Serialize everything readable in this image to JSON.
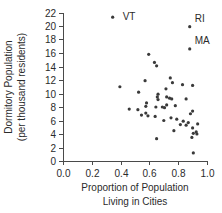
{
  "chart_data": {
    "type": "scatter",
    "title": "",
    "xlabel": "Proportion of Population Living in Cities",
    "xlabel_line1": "Proportion of Population",
    "xlabel_line2": "Living in Cities",
    "ylabel": "Dormitory Population (per thousand residents)",
    "ylabel_line1": "Dormitory Population",
    "ylabel_line2": "(per thousand residents)",
    "xlim": [
      0.0,
      1.0
    ],
    "ylim": [
      0,
      22
    ],
    "xticks": [
      "0.0",
      "0.2",
      "0.4",
      "0.6",
      "0.8",
      "1.0"
    ],
    "xtick_values": [
      0.0,
      0.2,
      0.4,
      0.6,
      0.8,
      1.0
    ],
    "yticks": [
      "0",
      "2",
      "4",
      "6",
      "8",
      "10",
      "12",
      "14",
      "16",
      "18",
      "20",
      "22"
    ],
    "ytick_values": [
      0,
      2,
      4,
      6,
      8,
      10,
      12,
      14,
      16,
      18,
      20,
      22
    ],
    "grid": false,
    "legend": false,
    "marker_color": "#3a3a3a",
    "axis_color": "#4a4a4a",
    "points": [
      {
        "x": 0.345,
        "y": 21.3,
        "label": "VT"
      },
      {
        "x": 0.88,
        "y": 19.9,
        "label": "RI"
      },
      {
        "x": 0.88,
        "y": 16.6,
        "label": "MA"
      },
      {
        "x": 0.595,
        "y": 15.8,
        "label": ""
      },
      {
        "x": 0.635,
        "y": 14.6,
        "label": ""
      },
      {
        "x": 0.65,
        "y": 14.1,
        "label": ""
      },
      {
        "x": 0.745,
        "y": 12.3,
        "label": ""
      },
      {
        "x": 0.57,
        "y": 11.9,
        "label": ""
      },
      {
        "x": 0.76,
        "y": 11.6,
        "label": ""
      },
      {
        "x": 0.83,
        "y": 11.3,
        "label": ""
      },
      {
        "x": 0.9,
        "y": 11.2,
        "label": ""
      },
      {
        "x": 0.395,
        "y": 11.0,
        "label": ""
      },
      {
        "x": 0.715,
        "y": 10.7,
        "label": ""
      },
      {
        "x": 0.525,
        "y": 10.2,
        "label": ""
      },
      {
        "x": 0.66,
        "y": 9.9,
        "label": ""
      },
      {
        "x": 0.655,
        "y": 9.5,
        "label": ""
      },
      {
        "x": 0.72,
        "y": 9.5,
        "label": ""
      },
      {
        "x": 0.74,
        "y": 9.3,
        "label": ""
      },
      {
        "x": 0.755,
        "y": 9.2,
        "label": ""
      },
      {
        "x": 0.855,
        "y": 9.2,
        "label": ""
      },
      {
        "x": 0.66,
        "y": 9.1,
        "label": ""
      },
      {
        "x": 0.58,
        "y": 8.6,
        "label": ""
      },
      {
        "x": 0.72,
        "y": 8.3,
        "label": ""
      },
      {
        "x": 0.78,
        "y": 8.2,
        "label": ""
      },
      {
        "x": 0.575,
        "y": 8.1,
        "label": ""
      },
      {
        "x": 0.645,
        "y": 8.0,
        "label": ""
      },
      {
        "x": 0.69,
        "y": 8.0,
        "label": ""
      },
      {
        "x": 0.705,
        "y": 7.9,
        "label": ""
      },
      {
        "x": 0.46,
        "y": 7.7,
        "label": ""
      },
      {
        "x": 0.52,
        "y": 7.6,
        "label": ""
      },
      {
        "x": 0.9,
        "y": 7.4,
        "label": ""
      },
      {
        "x": 0.575,
        "y": 7.1,
        "label": ""
      },
      {
        "x": 0.885,
        "y": 7.0,
        "label": ""
      },
      {
        "x": 0.545,
        "y": 6.8,
        "label": ""
      },
      {
        "x": 0.59,
        "y": 6.7,
        "label": ""
      },
      {
        "x": 0.64,
        "y": 6.6,
        "label": ""
      },
      {
        "x": 0.75,
        "y": 6.4,
        "label": ""
      },
      {
        "x": 0.79,
        "y": 6.2,
        "label": ""
      },
      {
        "x": 0.7,
        "y": 6.0,
        "label": ""
      },
      {
        "x": 0.835,
        "y": 5.9,
        "label": ""
      },
      {
        "x": 0.87,
        "y": 5.7,
        "label": ""
      },
      {
        "x": 0.935,
        "y": 5.5,
        "label": ""
      },
      {
        "x": 0.815,
        "y": 5.4,
        "label": ""
      },
      {
        "x": 0.855,
        "y": 5.3,
        "label": ""
      },
      {
        "x": 0.9,
        "y": 4.9,
        "label": ""
      },
      {
        "x": 0.77,
        "y": 4.5,
        "label": ""
      },
      {
        "x": 0.925,
        "y": 4.3,
        "label": ""
      },
      {
        "x": 0.905,
        "y": 4.1,
        "label": ""
      },
      {
        "x": 0.93,
        "y": 4.0,
        "label": ""
      },
      {
        "x": 0.895,
        "y": 3.5,
        "label": ""
      },
      {
        "x": 0.65,
        "y": 3.3,
        "label": ""
      },
      {
        "x": 0.905,
        "y": 1.2,
        "label": ""
      }
    ],
    "annotations": [
      {
        "text": "VT",
        "x": 0.345,
        "y": 21.3,
        "dx": 10,
        "dy": 3
      },
      {
        "text": "RI",
        "x": 0.88,
        "y": 19.9,
        "dx": 5,
        "dy": -5
      },
      {
        "text": "MA",
        "x": 0.88,
        "y": 16.6,
        "dx": 5,
        "dy": -5
      }
    ]
  }
}
